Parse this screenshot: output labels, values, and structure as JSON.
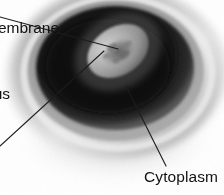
{
  "figure": {
    "kind": "cell-micrograph-diagram",
    "width": 224,
    "height": 195,
    "background_color": "#ffffff"
  },
  "labels": {
    "cytoplasm": "Cytoplasm",
    "membrane_cropped": "Cell membrane",
    "nucleus_cropped": "Nucleus"
  },
  "colors": {
    "background": "#ffffff",
    "outer_rim_light": "#c8c8c8",
    "rim_highlight": "#e4e4e4",
    "mid_band": "#8f8f8f",
    "cytoplasm_dark": "#1a1a1a",
    "cytoplasm_core": "#0d0d0d",
    "nucleus_bright": "#b4b4b4",
    "nucleus_mottle": "#6d6d6d",
    "leader_line": "#1c1c1c",
    "shadow": "#b9b9b9",
    "text": "#131313"
  },
  "structures": [
    {
      "name": "cell-membrane",
      "tone": "#c8c8c8"
    },
    {
      "name": "cytoplasm",
      "tone": "#1a1a1a"
    },
    {
      "name": "nucleus",
      "tone": "#b4b4b4"
    },
    {
      "name": "nucleolus",
      "tone": "#6d6d6d"
    }
  ],
  "leader_lines": [
    {
      "name": "membrane-leader",
      "from": [
        0,
        17
      ],
      "to": [
        118,
        49
      ]
    },
    {
      "name": "nucleus-leader",
      "from": [
        0,
        146
      ],
      "to": [
        104,
        51
      ]
    },
    {
      "name": "cytoplasm-leader",
      "from": [
        166,
        166
      ],
      "to": [
        126,
        86
      ]
    }
  ]
}
